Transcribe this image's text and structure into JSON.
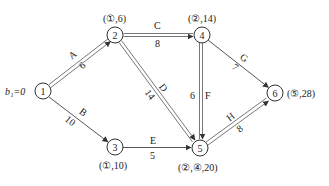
{
  "diagram": {
    "type": "network-shortest-path",
    "start_label": "b₁=0",
    "nodes": [
      {
        "id": "1",
        "label": "1",
        "x": 43,
        "y": 91,
        "annotation": ""
      },
      {
        "id": "2",
        "label": "2",
        "x": 115,
        "y": 35,
        "annotation": "(①,6)"
      },
      {
        "id": "3",
        "label": "3",
        "x": 115,
        "y": 147,
        "annotation": "(①,10)"
      },
      {
        "id": "4",
        "label": "4",
        "x": 202,
        "y": 35,
        "annotation": "(②,14)"
      },
      {
        "id": "5",
        "label": "5",
        "x": 200,
        "y": 148,
        "annotation": "(②,④,20)"
      },
      {
        "id": "6",
        "label": "6",
        "x": 275,
        "y": 93,
        "annotation": "(⑤,28)"
      }
    ],
    "edges": [
      {
        "from": "1",
        "to": "2",
        "name": "A",
        "weight": "6",
        "on_path": true
      },
      {
        "from": "1",
        "to": "3",
        "name": "B",
        "weight": "10",
        "on_path": false
      },
      {
        "from": "2",
        "to": "4",
        "name": "C",
        "weight": "8",
        "on_path": true
      },
      {
        "from": "2",
        "to": "5",
        "name": "D",
        "weight": "14",
        "on_path": true
      },
      {
        "from": "3",
        "to": "5",
        "name": "E",
        "weight": "5",
        "on_path": false
      },
      {
        "from": "4",
        "to": "5",
        "name": "F",
        "weight": "6",
        "on_path": true
      },
      {
        "from": "4",
        "to": "6",
        "name": "G",
        "weight": "7",
        "on_path": false
      },
      {
        "from": "5",
        "to": "6",
        "name": "H",
        "weight": "8",
        "on_path": true
      }
    ]
  }
}
